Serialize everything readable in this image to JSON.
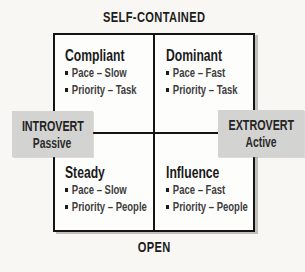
{
  "diagram": {
    "top_axis": "SELF-CONTAINED",
    "bottom_axis": "OPEN",
    "left_box": {
      "title": "INTROVERT",
      "subtitle": "Passive"
    },
    "right_box": {
      "title": "EXTROVERT",
      "subtitle": "Active"
    },
    "quadrants": [
      {
        "id": "top-left",
        "title": "Compliant",
        "bullets": [
          "Pace – Slow",
          "Priority – Task"
        ]
      },
      {
        "id": "top-right",
        "title": "Dominant",
        "bullets": [
          "Pace – Fast",
          "Priority – Task"
        ]
      },
      {
        "id": "bottom-left",
        "title": "Steady",
        "bullets": [
          "Pace – Slow",
          "Priority – People"
        ]
      },
      {
        "id": "bottom-right",
        "title": "Influence",
        "bullets": [
          "Pace – Fast",
          "Priority – People"
        ]
      }
    ],
    "colors": {
      "background": "#f8f7f4",
      "box_fill": "#d3d3d1",
      "line": "#141414",
      "bullet_text": "#3d3d3d"
    }
  }
}
